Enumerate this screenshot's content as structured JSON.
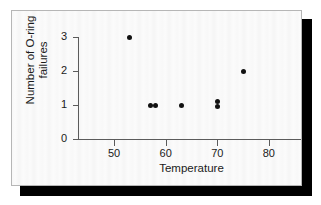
{
  "figure": {
    "background_color": "#fbfbfb",
    "border_color": "#b6b6b6",
    "shadow_color": "#000000"
  },
  "chart_data": {
    "type": "scatter",
    "title": "",
    "xlabel": "Temperature",
    "ylabel_lines": [
      "Number of O-ring",
      "failures"
    ],
    "ylabel": "Number of O-ring failures",
    "xlim": [
      43,
      87
    ],
    "ylim": [
      0,
      3.2
    ],
    "xticks": [
      50,
      60,
      70,
      80
    ],
    "xticklabels": [
      "50",
      "60",
      "70",
      "80"
    ],
    "yticks": [
      0,
      1,
      2,
      3
    ],
    "yticklabels": [
      "0",
      "1",
      "2",
      "3"
    ],
    "grid": false,
    "legend": null,
    "marker_color": "#111111",
    "points": [
      {
        "x": 53,
        "y": 3
      },
      {
        "x": 57,
        "y": 1
      },
      {
        "x": 58,
        "y": 1
      },
      {
        "x": 63,
        "y": 1
      },
      {
        "x": 70,
        "y": 1.1
      },
      {
        "x": 70,
        "y": 0.95
      },
      {
        "x": 75,
        "y": 2
      }
    ]
  }
}
